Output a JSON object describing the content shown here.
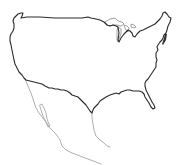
{
  "map": {
    "subject": "Outline map of the contiguous United States with northern Mexico",
    "background_color": "#ffffff",
    "regions": [
      {
        "name": "United States (contiguous)",
        "style": "dark outline",
        "color": "#2a2a2a"
      },
      {
        "name": "Great Lakes",
        "style": "light outline",
        "color": "#8a8a8a"
      },
      {
        "name": "Mexico / Baja California",
        "style": "light gray outline, partial",
        "color": "#9a9a9a"
      }
    ],
    "labels": []
  }
}
